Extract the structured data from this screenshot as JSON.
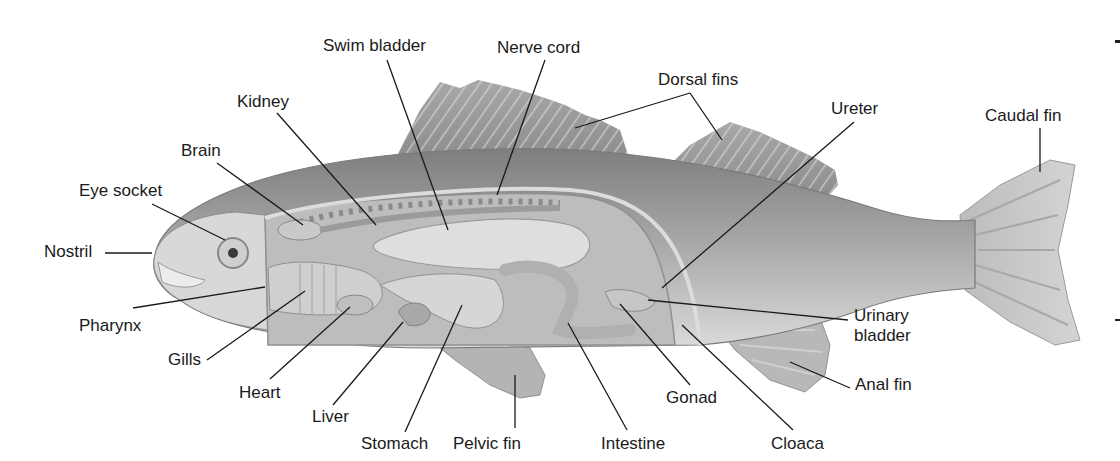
{
  "diagram": {
    "colors": {
      "background": "#ffffff",
      "body_dark": "#8a8a8a",
      "body_mid": "#b0b0b0",
      "body_light": "#d8d8d8",
      "organ": "#c8c8c8",
      "line": "#1a1a1a",
      "text": "#1a1a1a"
    },
    "labels": [
      {
        "id": "swim-bladder",
        "text": "Swim bladder",
        "x": 323,
        "y": 36
      },
      {
        "id": "nerve-cord",
        "text": "Nerve cord",
        "x": 497,
        "y": 38
      },
      {
        "id": "dorsal-fins",
        "text": "Dorsal fins",
        "x": 658,
        "y": 70
      },
      {
        "id": "kidney",
        "text": "Kidney",
        "x": 237,
        "y": 92
      },
      {
        "id": "ureter",
        "text": "Ureter",
        "x": 831,
        "y": 99
      },
      {
        "id": "caudal-fin",
        "text": "Caudal fin",
        "x": 985,
        "y": 106
      },
      {
        "id": "brain",
        "text": "Brain",
        "x": 181,
        "y": 141
      },
      {
        "id": "eye-socket",
        "text": "Eye socket",
        "x": 79,
        "y": 181
      },
      {
        "id": "nostril",
        "text": "Nostril",
        "x": 44,
        "y": 242
      },
      {
        "id": "pharynx",
        "text": "Pharynx",
        "x": 79,
        "y": 316
      },
      {
        "id": "urinary-bladder",
        "text": "Urinary bladder",
        "x": 854,
        "y": 306
      },
      {
        "id": "gills",
        "text": "Gills",
        "x": 168,
        "y": 350
      },
      {
        "id": "heart",
        "text": "Heart",
        "x": 239,
        "y": 383
      },
      {
        "id": "anal-fin",
        "text": "Anal fin",
        "x": 855,
        "y": 375
      },
      {
        "id": "gonad",
        "text": "Gonad",
        "x": 666,
        "y": 388
      },
      {
        "id": "liver",
        "text": "Liver",
        "x": 312,
        "y": 407
      },
      {
        "id": "stomach",
        "text": "Stomach",
        "x": 361,
        "y": 434
      },
      {
        "id": "pelvic-fin",
        "text": "Pelvic fin",
        "x": 453,
        "y": 434
      },
      {
        "id": "intestine",
        "text": "Intestine",
        "x": 601,
        "y": 434
      },
      {
        "id": "cloaca",
        "text": "Cloaca",
        "x": 771,
        "y": 434
      }
    ],
    "leaders": [
      {
        "id": "swim-bladder",
        "points": [
          [
            387,
            60
          ],
          [
            448,
            230
          ]
        ]
      },
      {
        "id": "nerve-cord",
        "points": [
          [
            545,
            60
          ],
          [
            497,
            195
          ]
        ]
      },
      {
        "id": "dorsal-fins",
        "points": [
          [
            690,
            93
          ],
          [
            575,
            128
          ]
        ]
      },
      {
        "id": "dorsal-fins-2",
        "points": [
          [
            690,
            93
          ],
          [
            722,
            140
          ]
        ]
      },
      {
        "id": "kidney",
        "points": [
          [
            277,
            113
          ],
          [
            376,
            225
          ]
        ]
      },
      {
        "id": "ureter",
        "points": [
          [
            854,
            122
          ],
          [
            662,
            288
          ]
        ]
      },
      {
        "id": "caudal-fin",
        "points": [
          [
            1040,
            128
          ],
          [
            1040,
            172
          ]
        ]
      },
      {
        "id": "brain",
        "points": [
          [
            217,
            163
          ],
          [
            303,
            225
          ]
        ]
      },
      {
        "id": "eye-socket",
        "points": [
          [
            152,
            204
          ],
          [
            225,
            240
          ]
        ]
      },
      {
        "id": "nostril",
        "points": [
          [
            105,
            253
          ],
          [
            152,
            253
          ]
        ]
      },
      {
        "id": "pharynx",
        "points": [
          [
            133,
            308
          ],
          [
            265,
            287
          ]
        ]
      },
      {
        "id": "urinary-bladder",
        "points": [
          [
            848,
            320
          ],
          [
            648,
            300
          ]
        ]
      },
      {
        "id": "gills",
        "points": [
          [
            207,
            360
          ],
          [
            305,
            291
          ]
        ]
      },
      {
        "id": "heart",
        "points": [
          [
            270,
            379
          ],
          [
            350,
            307
          ]
        ]
      },
      {
        "id": "anal-fin",
        "points": [
          [
            850,
            388
          ],
          [
            790,
            362
          ]
        ]
      },
      {
        "id": "gonad",
        "points": [
          [
            690,
            385
          ],
          [
            620,
            304
          ]
        ]
      },
      {
        "id": "liver",
        "points": [
          [
            333,
            405
          ],
          [
            403,
            322
          ]
        ]
      },
      {
        "id": "stomach",
        "points": [
          [
            405,
            432
          ],
          [
            462,
            305
          ]
        ]
      },
      {
        "id": "pelvic-fin",
        "points": [
          [
            515,
            428
          ],
          [
            515,
            375
          ]
        ]
      },
      {
        "id": "intestine",
        "points": [
          [
            627,
            430
          ],
          [
            568,
            323
          ]
        ]
      },
      {
        "id": "cloaca",
        "points": [
          [
            793,
            430
          ],
          [
            682,
            325
          ]
        ]
      }
    ]
  }
}
